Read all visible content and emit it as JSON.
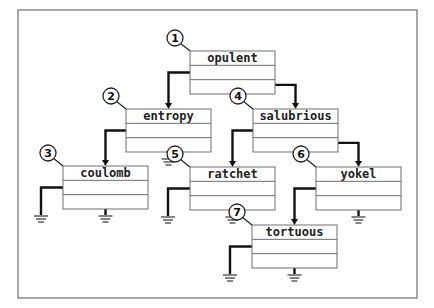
{
  "diagram": {
    "title": "",
    "type": "binary-search-tree",
    "frame": {
      "x": 18,
      "y": 10,
      "w": 399,
      "h": 288,
      "color": "#8a8a8a"
    },
    "colors": {
      "wire": "#111111",
      "box_stroke": "#6e6e6e",
      "text": "#222222"
    },
    "nodes": [
      {
        "id": 1,
        "label": "opulent",
        "x": 190,
        "y": 51,
        "w": 85,
        "h": 43
      },
      {
        "id": 2,
        "label": "entropy",
        "x": 126,
        "y": 109,
        "w": 85,
        "h": 43
      },
      {
        "id": 3,
        "label": "coulomb",
        "x": 63,
        "y": 166,
        "w": 85,
        "h": 43
      },
      {
        "id": 4,
        "label": "salubrious",
        "x": 253,
        "y": 109,
        "w": 85,
        "h": 43
      },
      {
        "id": 5,
        "label": "ratchet",
        "x": 190,
        "y": 167,
        "w": 85,
        "h": 43
      },
      {
        "id": 6,
        "label": "yokel",
        "x": 316,
        "y": 167,
        "w": 85,
        "h": 43
      },
      {
        "id": 7,
        "label": "tortuous",
        "x": 252,
        "y": 225,
        "w": 85,
        "h": 43
      }
    ],
    "edges": [
      {
        "from": 1,
        "to": 2,
        "side": "left"
      },
      {
        "from": 1,
        "to": 4,
        "side": "right"
      },
      {
        "from": 2,
        "to": 3,
        "side": "left"
      },
      {
        "from": 4,
        "to": 5,
        "side": "left"
      },
      {
        "from": 4,
        "to": 6,
        "side": "right"
      },
      {
        "from": 6,
        "to": 7,
        "side": "left"
      }
    ],
    "null_pointers": [
      {
        "node": 2,
        "side": "right"
      },
      {
        "node": 3,
        "side": "left"
      },
      {
        "node": 3,
        "side": "right"
      },
      {
        "node": 5,
        "side": "left"
      },
      {
        "node": 5,
        "side": "right"
      },
      {
        "node": 6,
        "side": "right"
      },
      {
        "node": 7,
        "side": "left"
      },
      {
        "node": 7,
        "side": "right"
      }
    ],
    "badges": [
      {
        "label": "1",
        "node": 1
      },
      {
        "label": "2",
        "node": 2
      },
      {
        "label": "3",
        "node": 3
      },
      {
        "label": "4",
        "node": 4
      },
      {
        "label": "5",
        "node": 5
      },
      {
        "label": "6",
        "node": 6
      },
      {
        "label": "7",
        "node": 7
      }
    ]
  }
}
